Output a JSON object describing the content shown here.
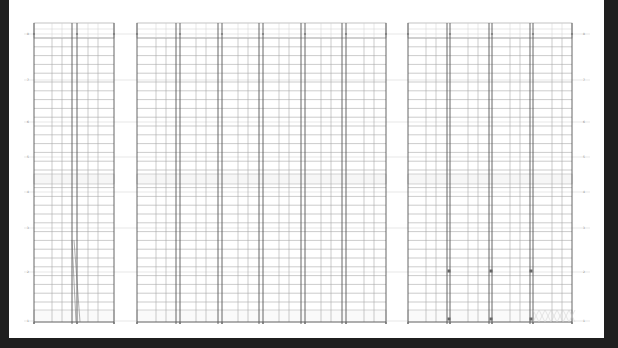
{
  "viewer": {
    "background": "#1f1f1f",
    "sheet_color": "#ffffff"
  },
  "drawing": {
    "line_color_major": "#555555",
    "line_color_minor": "#aaaaaa",
    "line_color_faint": "#cfcfcf",
    "level_rows_y": [
      34,
      80,
      122,
      157,
      192,
      228,
      272,
      321
    ],
    "level_labels": [
      "8",
      "7",
      "6",
      "5",
      "4",
      "3",
      "2",
      "1"
    ],
    "grid_top": 23,
    "grid_bottom": 322,
    "header_band": [
      23,
      38
    ],
    "mid_band": [
      174,
      184
    ],
    "base_band": [
      310,
      322
    ],
    "row_step": 8.8,
    "panels": [
      {
        "name": "panel-left",
        "x0": 34,
        "x1": 114,
        "bays": [
          34,
          72,
          77,
          114
        ],
        "minor_cols": [
          52,
          62,
          88,
          98
        ],
        "has_diagonal": true
      },
      {
        "name": "panel-middle",
        "x0": 137,
        "x1": 386,
        "bays": [
          137,
          176,
          180,
          218,
          222,
          259,
          263,
          301,
          305,
          342,
          346,
          386
        ],
        "minor_cols": [
          156,
          166,
          196,
          206,
          238,
          248,
          279,
          289,
          321,
          331,
          364,
          374
        ],
        "has_diagonal": false
      },
      {
        "name": "panel-right",
        "x0": 408,
        "x1": 572,
        "bays": [
          408,
          447,
          450,
          489,
          492,
          530,
          533,
          572
        ],
        "minor_cols": [
          426,
          436,
          468,
          478,
          510,
          520,
          552,
          562
        ],
        "has_diagonal": false,
        "markers_y": [
          271,
          319
        ],
        "markers_x": [
          449,
          491,
          531
        ],
        "hatch_bay": [
          533,
          572
        ]
      }
    ]
  }
}
